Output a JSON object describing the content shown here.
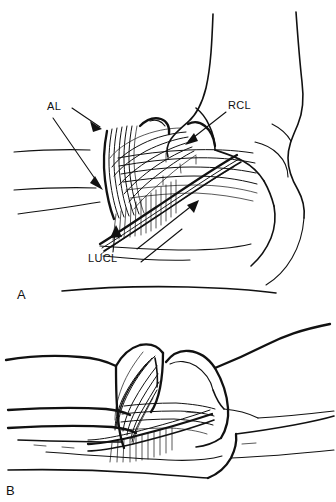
{
  "figure": {
    "background_color": "#ffffff",
    "ink_color": "#111111",
    "width": 336,
    "height": 502,
    "style": "line-art anatomical drawing"
  },
  "panels": [
    {
      "id": "A",
      "label": "A",
      "caption_view": "flexed elbow, lateral view",
      "annotations": [
        {
          "id": "al",
          "label": "AL",
          "name": "annular ligament",
          "arrow_count": 2,
          "arrow_direction": "down-right"
        },
        {
          "id": "rcl",
          "label": "RCL",
          "name": "radial collateral ligament",
          "arrow_count": 1,
          "arrow_direction": "down-left"
        },
        {
          "id": "lucl",
          "label": "LUCL",
          "name": "lateral ulnar collateral ligament",
          "arrow_count": 2,
          "arrow_direction": "up and up-left"
        }
      ]
    },
    {
      "id": "B",
      "label": "B",
      "caption_view": "extended elbow, lateral view",
      "annotations": []
    }
  ],
  "labels": {
    "panel_a": "A",
    "panel_b": "B",
    "al": "AL",
    "rcl": "RCL",
    "lucl": "LUCL"
  }
}
